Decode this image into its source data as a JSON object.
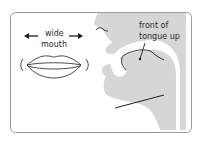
{
  "diagram": {
    "labels": {
      "wide": "wide",
      "mouth": "mouth",
      "front_of": "front of",
      "tongue_up": "tongue up"
    },
    "colors": {
      "frame_border": "#9a9a9a",
      "profile_fill": "#d6d6d6",
      "line": "#1e1e1e",
      "background": "#ffffff"
    },
    "icons": [
      "arrow-left-icon",
      "arrow-right-icon"
    ]
  }
}
